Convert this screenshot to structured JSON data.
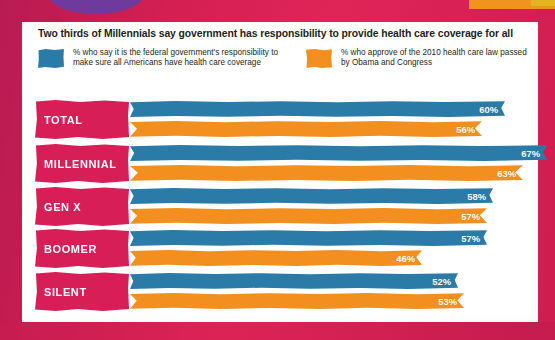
{
  "title": "Two thirds of Millennials say government has responsibility to provide health care coverage for all",
  "legend": [
    {
      "key": "blue",
      "color": "#2a7ba8",
      "label": "% who say it is the federal government's responsibility to make sure all Americans have health care coverage"
    },
    {
      "key": "orange",
      "color": "#f28f1e",
      "label": "% who approve of the 2010 health care law passed by Obama and Congress"
    }
  ],
  "colors": {
    "blue": "#2a7ba8",
    "orange": "#f28f1e",
    "magenta": "#d81e56",
    "background": "#cf1f51",
    "card": "#ffffff",
    "text": "#231f20",
    "purple": "#6e3b9c"
  },
  "chart_data": {
    "type": "bar",
    "title": "Two thirds of Millennials say government has responsibility to provide health care coverage for all",
    "xlabel": "",
    "ylabel": "",
    "xlim": [
      0,
      70
    ],
    "grid": false,
    "legend_position": "top",
    "orientation": "horizontal",
    "categories": [
      "TOTAL",
      "MILLENNIAL",
      "GEN X",
      "BOOMER",
      "SILENT"
    ],
    "series": [
      {
        "name": "% who say it is the federal government's responsibility to make sure all Americans have health care coverage",
        "color": "#2a7ba8",
        "values": [
          60,
          67,
          58,
          57,
          52
        ],
        "labels": [
          "60%",
          "67%",
          "58%",
          "57%",
          "52%"
        ]
      },
      {
        "name": "% who approve of the 2010 health care law passed by Obama and Congress",
        "color": "#f28f1e",
        "values": [
          56,
          63,
          57,
          46,
          53
        ],
        "labels": [
          "56%",
          "63%",
          "57%",
          "46%",
          "53%"
        ]
      }
    ]
  }
}
